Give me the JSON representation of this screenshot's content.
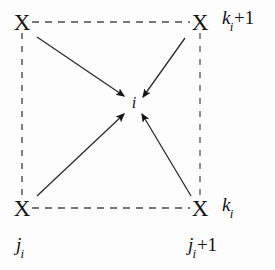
{
  "figure": {
    "type": "diagram",
    "background_color": "#fdfdfd",
    "line_color": "#3a3a3a",
    "text_color": "#111111"
  },
  "nodes": [
    {
      "id": "top-left",
      "glyph": "X",
      "x": 22,
      "y": 22
    },
    {
      "id": "top-right",
      "glyph": "X",
      "x": 200,
      "y": 22
    },
    {
      "id": "bottom-left",
      "glyph": "X",
      "x": 22,
      "y": 208
    },
    {
      "id": "bottom-right",
      "glyph": "X",
      "x": 200,
      "y": 208
    }
  ],
  "center": {
    "label": "i",
    "x": 134,
    "y": 103
  },
  "labels": {
    "k_top": {
      "sym": "k",
      "sub": "i",
      "plus": "+1",
      "x": 222,
      "y": 20
    },
    "k_bottom": {
      "sym": "k",
      "sub": "i",
      "plus": "",
      "x": 222,
      "y": 207
    },
    "j_left": {
      "sym": "j",
      "sub": "i",
      "plus": "",
      "x": 16,
      "y": 247
    },
    "j_right": {
      "sym": "j",
      "sub": "i",
      "plus": "+1",
      "x": 188,
      "y": 247
    }
  },
  "dashed_edges": [
    {
      "id": "top-edge",
      "x1": 32,
      "y1": 22,
      "x2": 190,
      "y2": 22
    },
    {
      "id": "bottom-edge",
      "x1": 32,
      "y1": 208,
      "x2": 190,
      "y2": 208
    },
    {
      "id": "left-edge",
      "x1": 22,
      "y1": 33,
      "x2": 22,
      "y2": 197
    },
    {
      "id": "right-edge",
      "x1": 200,
      "y1": 33,
      "x2": 200,
      "y2": 197
    }
  ],
  "arrows": [
    {
      "id": "arrow-from-top-left",
      "x1": 37,
      "y1": 37,
      "x2": 124,
      "y2": 96
    },
    {
      "id": "arrow-from-top-right",
      "x1": 185,
      "y1": 38,
      "x2": 143,
      "y2": 97
    },
    {
      "id": "arrow-from-bottom-left",
      "x1": 37,
      "y1": 196,
      "x2": 124,
      "y2": 114
    },
    {
      "id": "arrow-from-bottom-right",
      "x1": 191,
      "y1": 196,
      "x2": 142,
      "y2": 114
    }
  ]
}
